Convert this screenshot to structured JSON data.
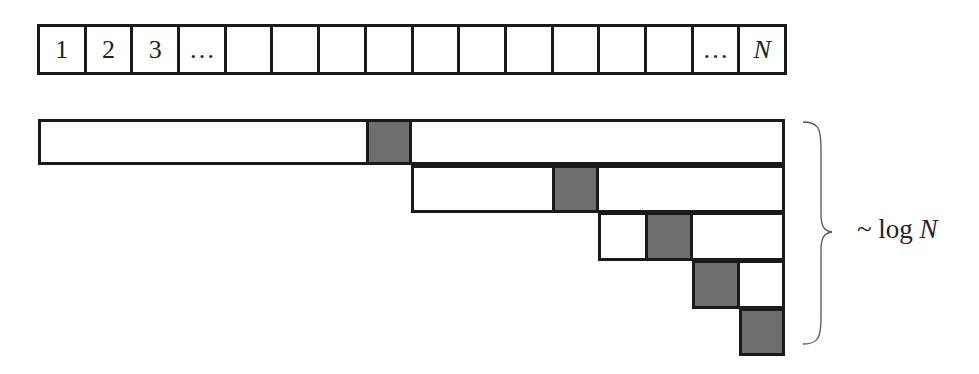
{
  "diagram": {
    "array": {
      "cell_count": 16,
      "cells": [
        "1",
        "2",
        "3",
        "…",
        "",
        "",
        "",
        "",
        "",
        "",
        "",
        "",
        "",
        "",
        "…",
        "N"
      ]
    },
    "bars": [
      {
        "x": 38,
        "y": 119,
        "w": 747,
        "h": 46,
        "pivot_x": 366
      },
      {
        "x": 411,
        "y": 165,
        "w": 374,
        "h": 48,
        "pivot_x": 552
      },
      {
        "x": 598,
        "y": 212,
        "w": 187,
        "h": 49,
        "pivot_x": 645
      },
      {
        "x": 692,
        "y": 260,
        "w": 93,
        "h": 49,
        "pivot_x": 692
      },
      {
        "x": 739,
        "y": 308,
        "w": 46,
        "h": 48,
        "pivot_x": 739
      }
    ],
    "pivot_color": "#6e6e6e",
    "brace_label": {
      "prefix": "~ log ",
      "variable": "N"
    }
  }
}
